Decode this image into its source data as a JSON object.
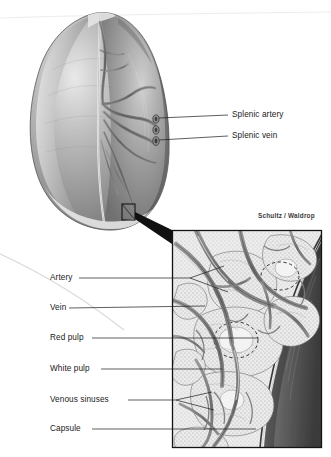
{
  "figure": {
    "credit": "Schultz / Waldrop",
    "background_color": "#ffffff",
    "ink_color": "#1a1a1a"
  },
  "overview": {
    "name": "spleen-overview",
    "description": "Gray-shaded whole spleen, hilum with branching vessels",
    "labels": [
      {
        "id": "splenic-artery",
        "text": "Splenic artery",
        "x": 232,
        "y": 118
      },
      {
        "id": "splenic-vein",
        "text": "Splenic vein",
        "x": 232,
        "y": 139
      }
    ],
    "callout_box": {
      "x": 122,
      "y": 204,
      "w": 13,
      "h": 16
    }
  },
  "inset": {
    "name": "spleen-detail-inset",
    "frame": {
      "x": 172,
      "y": 230,
      "w": 150,
      "h": 218
    },
    "labels": [
      {
        "id": "artery",
        "text": "Artery",
        "x": 50,
        "y": 281
      },
      {
        "id": "vein",
        "text": "Vein",
        "x": 50,
        "y": 311
      },
      {
        "id": "red-pulp",
        "text": "Red pulp",
        "x": 50,
        "y": 341
      },
      {
        "id": "white-pulp",
        "text": "White pulp",
        "x": 50,
        "y": 372
      },
      {
        "id": "venous-sinuses",
        "text": "Venous sinuses",
        "x": 50,
        "y": 403
      },
      {
        "id": "capsule",
        "text": "Capsule",
        "x": 50,
        "y": 432
      }
    ]
  },
  "palette": {
    "tissue_mid": "#8a8a8a",
    "tissue_light": "#d8d8d8",
    "tissue_dark": "#4a4a4a",
    "vessel_gray": "#6f6f6f",
    "pulp_light": "#e6e6e6",
    "frame": "#1a1a1a"
  }
}
